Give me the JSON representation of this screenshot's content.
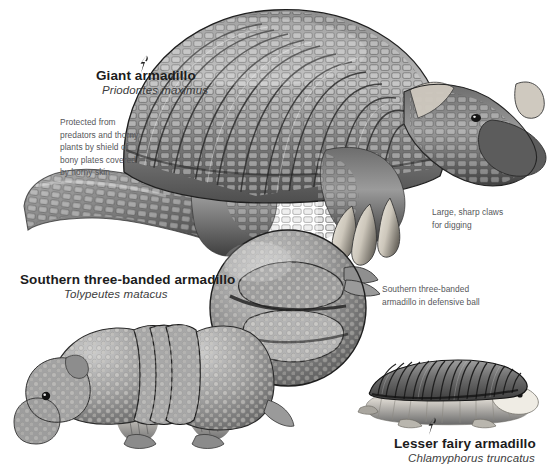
{
  "plate": {
    "title": "Armadillos illustration plate",
    "background_color": "#ffffff",
    "text_color": "#4a4a4a",
    "heading_color": "#1c1c1c"
  },
  "species": [
    {
      "id": "giant-armadillo",
      "common_name": "Giant armadillo",
      "scientific_name": "Priodontes maximus",
      "pointer_icon": "bolt-pointer-icon"
    },
    {
      "id": "southern-three-banded-armadillo",
      "common_name": "Southern three-banded armadillo",
      "scientific_name": "Tolypeutes matacus",
      "pointer_icon": ""
    },
    {
      "id": "lesser-fairy-armadillo",
      "common_name": "Lesser fairy armadillo",
      "scientific_name": "Chlamyphorus truncatus",
      "pointer_icon": "bolt-pointer-icon"
    }
  ],
  "annotations": {
    "armor": "Protected from\npredators and thorny\nplants by shield of\nbony plates covered\nby horny skin",
    "claws": "Large, sharp claws\nfor digging",
    "defensive_ball": "Southern three-banded\narmadillo in defensive ball"
  },
  "figures": [
    {
      "id": "giant-armadillo-figure",
      "caption": "Giant armadillo standing in profile facing right"
    },
    {
      "id": "defensive-ball-figure",
      "caption": "Southern three-banded armadillo rolled into a ball"
    },
    {
      "id": "three-banded-armadillo-figure",
      "caption": "Southern three-banded armadillo walking, facing left"
    },
    {
      "id": "fairy-armadillo-figure",
      "caption": "Lesser fairy armadillo in profile facing right"
    }
  ]
}
